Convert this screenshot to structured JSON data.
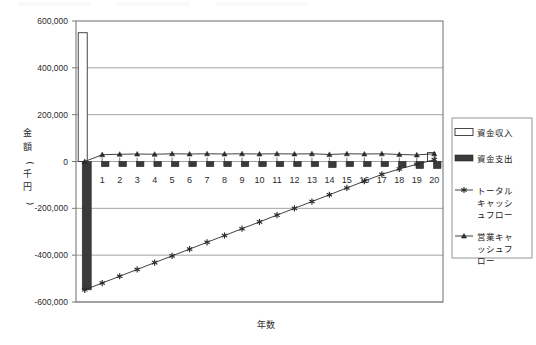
{
  "chart_data": {
    "type": "bar",
    "title": "",
    "xlabel": "年数",
    "ylabel": "金額(千円)",
    "categories": [
      "0",
      "1",
      "2",
      "3",
      "4",
      "5",
      "6",
      "7",
      "8",
      "9",
      "10",
      "11",
      "12",
      "13",
      "14",
      "15",
      "16",
      "17",
      "18",
      "19",
      "20"
    ],
    "ylim": [
      -600000,
      600000
    ],
    "ytick_labels": [
      "600,000",
      "400,000",
      "200,000",
      "0",
      "-200,000",
      "-400,000",
      "-600,000"
    ],
    "ytick_values": [
      600000,
      400000,
      200000,
      0,
      -200000,
      -400000,
      -600000
    ],
    "grid": true,
    "legend_position": "right",
    "series": [
      {
        "name": "資金収入",
        "type": "bar",
        "marker": "hollow-bar",
        "color": "#ffffff",
        "edge_color": "#333333",
        "values": [
          550000,
          0,
          0,
          0,
          0,
          0,
          0,
          0,
          0,
          0,
          0,
          0,
          0,
          0,
          0,
          0,
          0,
          0,
          0,
          0,
          38000
        ]
      },
      {
        "name": "資金支出",
        "type": "bar",
        "marker": "solid-bar",
        "color": "#3a3a3a",
        "values": [
          -548000,
          -22000,
          -22000,
          -22000,
          -22000,
          -22000,
          -22000,
          -22000,
          -22000,
          -22000,
          -22000,
          -22000,
          -22000,
          -22000,
          -26000,
          -22000,
          -22000,
          -22000,
          -26000,
          -30000,
          -30000
        ]
      },
      {
        "name": "トータルキャッシュフロー",
        "type": "line",
        "marker": "asterisk",
        "color": "#2b2b2b",
        "values": [
          -548000,
          -519000,
          -490000,
          -461000,
          -432000,
          -403000,
          -374000,
          -345000,
          -316000,
          -287000,
          -258000,
          -229000,
          -200000,
          -171000,
          -142000,
          -113000,
          -84000,
          -55000,
          -32000,
          -12000,
          8000
        ]
      },
      {
        "name": "営業キャッシュフロー",
        "type": "line",
        "marker": "triangle",
        "color": "#2b2b2b",
        "values": [
          0,
          29000,
          31000,
          32000,
          31000,
          33000,
          32000,
          33000,
          32000,
          33000,
          32000,
          33000,
          32000,
          33000,
          30000,
          33000,
          32000,
          33000,
          30000,
          28000,
          33000
        ]
      }
    ]
  },
  "legend": {
    "items": [
      {
        "label": "資金収入",
        "marker": "hollow-bar"
      },
      {
        "label": "資金支出",
        "marker": "solid-bar"
      },
      {
        "label": "トータル\nキャッシ\nュフロー",
        "marker": "asterisk",
        "lines": [
          "トータル",
          "キャッシ",
          "ュフロー"
        ]
      },
      {
        "label": "営業キャ\nッシュフ\nロー",
        "marker": "triangle",
        "lines": [
          "営業キャ",
          "ッシュフ",
          "ロー"
        ]
      }
    ]
  },
  "colors": {
    "frame": "#7a7a7a",
    "grid": "#8a8a8a",
    "income_fill": "#ffffff",
    "expense_fill": "#3a3a3a",
    "line": "#2b2b2b",
    "text": "#2b2b2b",
    "background": "#ffffff"
  }
}
